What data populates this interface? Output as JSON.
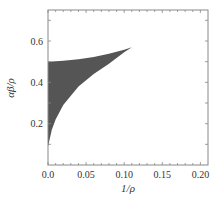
{
  "chart_data": {
    "type": "area",
    "title": "",
    "xlabel": "1/ρ",
    "ylabel": "αβ/ρ",
    "xlim": [
      0,
      0.21
    ],
    "ylim": [
      0,
      0.75
    ],
    "xticks": [
      "0.0",
      "0.05",
      "0.10",
      "0.15",
      "0.20"
    ],
    "yticks": [
      "0.2",
      "0.4",
      "0.6"
    ],
    "grid": false,
    "legend": null,
    "series": [
      {
        "name": "upper boundary",
        "x": [
          0.0,
          0.02,
          0.04,
          0.06,
          0.08,
          0.1,
          0.11
        ],
        "y": [
          0.5,
          0.505,
          0.512,
          0.523,
          0.538,
          0.558,
          0.57
        ]
      },
      {
        "name": "lower boundary",
        "x": [
          0.0,
          0.005,
          0.01,
          0.02,
          0.04,
          0.06,
          0.08,
          0.1,
          0.11
        ],
        "y": [
          0.09,
          0.17,
          0.22,
          0.29,
          0.38,
          0.44,
          0.49,
          0.545,
          0.57
        ]
      }
    ],
    "fill_color": "#555555"
  }
}
